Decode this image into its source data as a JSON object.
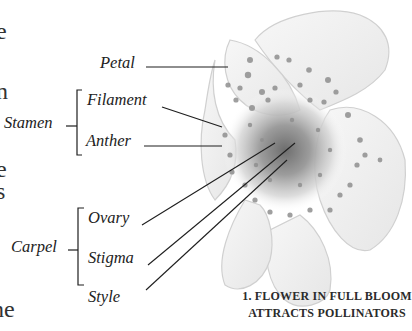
{
  "left_text_fragments": [
    "e",
    "n",
    "e",
    "s",
    "ne"
  ],
  "labels": {
    "petal": "Petal",
    "stamen_group": "Stamen",
    "filament": "Filament",
    "anther": "Anther",
    "carpel_group": "Carpel",
    "ovary": "Ovary",
    "stigma": "Stigma",
    "style": "Style"
  },
  "caption": {
    "line1": "1. FLOWER IN FULL BLOOM",
    "line2": "ATTRACTS POLLINATORS"
  },
  "colors": {
    "background": "#ffffff",
    "ink": "#222222",
    "flower_shade": "#9a9a9a"
  }
}
